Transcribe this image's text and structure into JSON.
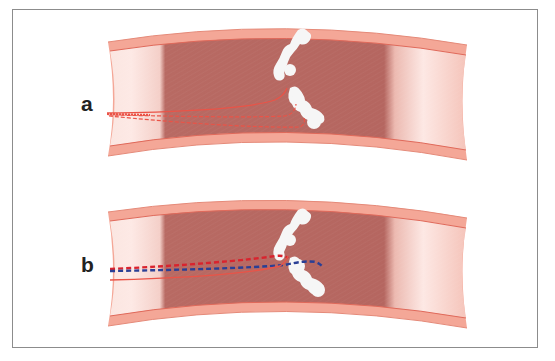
{
  "figure": {
    "panels": [
      {
        "label": "a",
        "description": "Curved vessel with white occlusion; red guidewire tracks with dashed subintimal paths",
        "wires": [
          {
            "style": "solid",
            "color": "#e8473e"
          },
          {
            "style": "dashed",
            "color": "#e8473e"
          },
          {
            "style": "dashed",
            "color": "#e8473e"
          }
        ]
      },
      {
        "label": "b",
        "description": "Curved vessel with white occlusion; red and blue dashed wires crossing lesion",
        "wires": [
          {
            "style": "dashed",
            "color": "#d9232e"
          },
          {
            "style": "dashed",
            "color": "#2a3f95"
          },
          {
            "style": "solid",
            "color": "#e8473e"
          }
        ]
      }
    ],
    "colors": {
      "vessel_wall": "#f2a493",
      "vessel_wall_edge": "#e07766",
      "lumen_dark": "#b56660",
      "lumen_light": "#fbe3de",
      "occlusion": "#f4f4f4",
      "frame": "#8c8c8c"
    }
  }
}
